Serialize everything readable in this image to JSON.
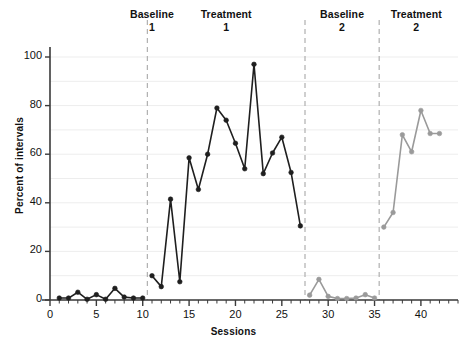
{
  "chart_data": {
    "type": "line",
    "title": "",
    "xlabel": "Sessions",
    "ylabel": "Percent of intervals",
    "xlim": [
      0,
      44
    ],
    "ylim": [
      0,
      105
    ],
    "grid": true,
    "legend": "none",
    "yticks": [
      0,
      20,
      40,
      60,
      80,
      100
    ],
    "xticks": [
      0,
      5,
      10,
      15,
      20,
      25,
      30,
      35,
      40
    ],
    "xtick_minor_step": 1,
    "phase_labels": [
      {
        "name": "Baseline",
        "number": "1",
        "x_center": 11.0
      },
      {
        "name": "Treatment",
        "number": "1",
        "x_center": 19.0
      },
      {
        "name": "Baseline",
        "number": "2",
        "x_center": 31.5
      },
      {
        "name": "Treatment",
        "number": "2",
        "x_center": 39.5
      }
    ],
    "phase_dividers": [
      10.5,
      27.5,
      35.5
    ],
    "colors": {
      "series_dark": "#1f1f1f",
      "series_gray": "#9a9a9a",
      "gridline": "#ededed",
      "divider": "#b0b0b0",
      "axis": "#3a3a3a"
    },
    "series": [
      {
        "name": "Baseline 1",
        "color": "#1f1f1f",
        "x": [
          1,
          2,
          3,
          4,
          5,
          6,
          7,
          8,
          9,
          10
        ],
        "values": [
          0.8,
          0.8,
          3.2,
          0.3,
          2.2,
          0.3,
          4.8,
          1.2,
          0.8,
          0.8
        ]
      },
      {
        "name": "Treatment 1",
        "color": "#1f1f1f",
        "x": [
          11,
          12,
          13,
          14,
          15,
          16,
          17,
          18,
          19,
          20,
          21,
          22,
          23,
          24,
          25,
          26,
          27
        ],
        "values": [
          10.0,
          5.5,
          41.5,
          7.5,
          58.5,
          45.5,
          60.0,
          79.0,
          74.0,
          64.5,
          54.0,
          97.0,
          52.0,
          60.5,
          67.0,
          52.5,
          30.5
        ]
      },
      {
        "name": "Baseline 2",
        "color": "#9a9a9a",
        "x": [
          28,
          29,
          30,
          31,
          32,
          33,
          34,
          35
        ],
        "values": [
          2.0,
          8.5,
          1.5,
          0.6,
          0.6,
          0.8,
          2.2,
          0.8
        ]
      },
      {
        "name": "Treatment 2",
        "color": "#9a9a9a",
        "x": [
          36,
          37,
          38,
          39,
          40,
          41,
          42
        ],
        "values": [
          30.0,
          36.0,
          68.0,
          61.0,
          78.0,
          68.5,
          68.5
        ]
      }
    ]
  }
}
